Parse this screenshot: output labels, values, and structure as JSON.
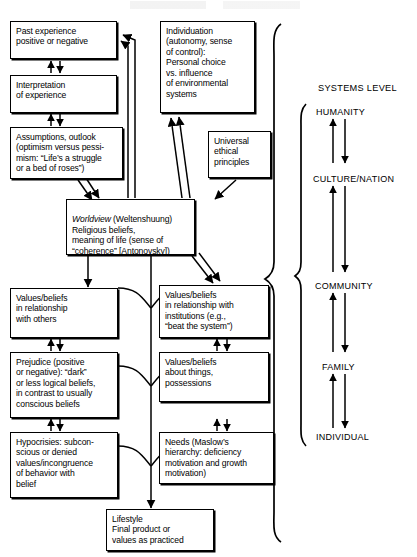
{
  "figure": {
    "systems_level_heading": "SYSTEMS LEVEL",
    "ink_color": "#000000",
    "background_color": "#ffffff"
  },
  "boxes": [
    {
      "id": "past-experience",
      "text": "Past experience\npositive or negative"
    },
    {
      "id": "interpretation",
      "text": "Interpretation\nof experience"
    },
    {
      "id": "assumptions",
      "text": "Assumptions, outlook\n(optimism versus pessi-\nmism: “Life’s a struggle\nor a bed of roses”)"
    },
    {
      "id": "individuation",
      "text": "Individuation\n(autonomy, sense\nof control):\nPersonal choice\nvs. influence\nof environmental\nsystems"
    },
    {
      "id": "universal-ethics",
      "text": "Universal\nethical\nprinciples"
    },
    {
      "id": "worldview",
      "text_italic": "Worldview",
      "text": " (Weltenshuung)\nReligious beliefs,\nmeaning of life (sense of\n“coherence” [Antonovsky])"
    },
    {
      "id": "values-others",
      "text": "Values/beliefs\nin relationship\nwith others"
    },
    {
      "id": "values-institutions",
      "text": "Values/beliefs\nin relationship with\ninstitutions (e.g.,\n“beat the system”)"
    },
    {
      "id": "prejudice",
      "text": "Prejudice (positive\nor negative): “dark”\nor less logical beliefs,\nin contrast to usually\nconscious beliefs"
    },
    {
      "id": "values-things",
      "text": "Values/beliefs\nabout things,\npossessions"
    },
    {
      "id": "hypocrisies",
      "text": "Hypocrisies: subcon-\nscious or denied\nvalues/incongruence\nof behavior with\nbelief"
    },
    {
      "id": "needs",
      "text": "Needs (Maslow’s\nhierarchy: deficiency\nmotivation and growth\nmotivation)"
    },
    {
      "id": "lifestyle",
      "text": "Lifestyle\nFinal product or\nvalues as practiced"
    }
  ],
  "systems_levels": [
    {
      "id": "humanity",
      "label": "HUMANITY"
    },
    {
      "id": "culture-nation",
      "label": "CULTURE/NATION"
    },
    {
      "id": "community",
      "label": "COMMUNITY"
    },
    {
      "id": "family",
      "label": "FAMILY"
    },
    {
      "id": "individual",
      "label": "INDIVIDUAL"
    }
  ]
}
